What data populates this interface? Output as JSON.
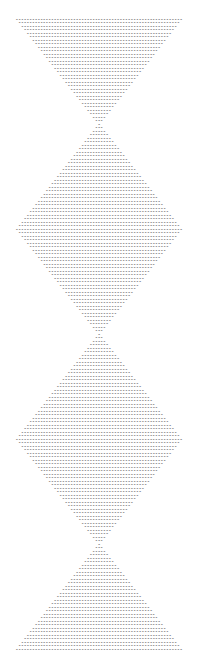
{
  "canvas": {
    "width": 198,
    "height": 413,
    "background_color": "#ffffff"
  },
  "art": {
    "kind": "ascii-art",
    "glyph": "-",
    "glyph_name": "hyphen-minus",
    "ink_color": "#5a5a5a",
    "font_style": "monospace-bold",
    "char_cell_width_px": 2.72,
    "char_cell_height_px": 3.5,
    "first_row_top_px": 13,
    "last_row_bottom_px": 397,
    "left_edge_px": 17,
    "right_edge_px": 183,
    "max_row_chars": 61,
    "min_row_chars": 1,
    "total_rows": 110,
    "shape_description": "Vertical chain of diamonds: inverted triangle, two full diamonds, upright triangle, joined at single-character waists",
    "segments": [
      {
        "name": "top-inverted-triangle",
        "start_chars": 61,
        "end_chars": 1,
        "step": -2,
        "rows": 31
      },
      {
        "name": "diamond-one-upper",
        "start_chars": 3,
        "end_chars": 61,
        "step": 2,
        "rows": 30
      },
      {
        "name": "diamond-one-lower",
        "start_chars": 59,
        "end_chars": 1,
        "step": -2,
        "rows": 30
      },
      {
        "name": "diamond-two-upper",
        "start_chars": 3,
        "end_chars": 61,
        "step": 2,
        "rows": 30
      },
      {
        "name": "diamond-two-lower",
        "start_chars": 59,
        "end_chars": 1,
        "step": -2,
        "rows": 30
      },
      {
        "name": "bottom-upright-triangle",
        "start_chars": 3,
        "end_chars": 61,
        "step": 2,
        "rows": 30
      }
    ],
    "row_char_counts": [
      61,
      59,
      57,
      55,
      53,
      51,
      49,
      47,
      45,
      43,
      41,
      39,
      37,
      35,
      33,
      31,
      29,
      27,
      25,
      23,
      21,
      19,
      17,
      15,
      13,
      11,
      9,
      7,
      5,
      3,
      1,
      3,
      5,
      7,
      9,
      11,
      13,
      15,
      17,
      19,
      21,
      23,
      25,
      27,
      29,
      31,
      33,
      35,
      37,
      39,
      41,
      43,
      45,
      47,
      49,
      51,
      53,
      55,
      57,
      59,
      61,
      59,
      57,
      55,
      53,
      51,
      49,
      47,
      45,
      43,
      41,
      39,
      37,
      35,
      33,
      31,
      29,
      27,
      25,
      23,
      21,
      19,
      17,
      15,
      13,
      11,
      9,
      7,
      5,
      3,
      1,
      3,
      5,
      7,
      9,
      11,
      13,
      15,
      17,
      19,
      21,
      23,
      25,
      27,
      29,
      31,
      33,
      35,
      37,
      39,
      41,
      43,
      45,
      47,
      49,
      51,
      53,
      55,
      57,
      59,
      61,
      59,
      57,
      55,
      53,
      51,
      49,
      47,
      45,
      43,
      41,
      39,
      37,
      35,
      33,
      31,
      29,
      27,
      25,
      23,
      21,
      19,
      17,
      15,
      13,
      11,
      9,
      7,
      5,
      3,
      1,
      3,
      5,
      7,
      9,
      11,
      13,
      15,
      17,
      19,
      21,
      23,
      25,
      27,
      29,
      31,
      33,
      35,
      37,
      39,
      41,
      43,
      45,
      47,
      49,
      51,
      53,
      55,
      57,
      59,
      61
    ]
  }
}
